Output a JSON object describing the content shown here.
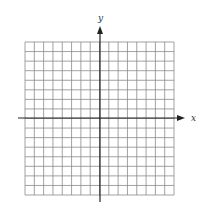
{
  "diagram": {
    "type": "coordinate-grid",
    "x_axis_label": "x",
    "y_axis_label": "y",
    "grid": {
      "columns": 16,
      "rows": 16,
      "left": 25,
      "top": 42,
      "right": 174,
      "bottom": 195,
      "line_color": "#8a8a8a",
      "border_color": "#8a8a8a"
    },
    "axes": {
      "origin_x": 100,
      "origin_y": 118,
      "x_start": 18,
      "x_end": 185,
      "y_top": 26,
      "y_bottom": 202,
      "color": "#222222"
    }
  }
}
